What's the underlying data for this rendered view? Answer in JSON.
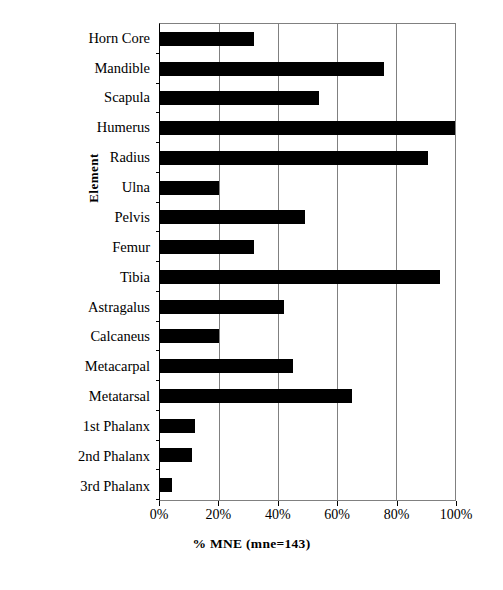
{
  "chart_data": {
    "type": "bar",
    "orientation": "horizontal",
    "title": "",
    "xlabel": "%  MNE (mne=143)",
    "ylabel": "Element",
    "xlim": [
      0,
      100
    ],
    "grid": true,
    "legend": false,
    "bar_color": "#000000",
    "grid_color": "#808080",
    "categories": [
      "Horn Core",
      "Mandible",
      "Scapula",
      "Humerus",
      "Radius",
      "Ulna",
      "Pelvis",
      "Femur",
      "Tibia",
      "Astragalus",
      "Calcaneus",
      "Metacarpal",
      "Metatarsal",
      "1st Phalanx",
      "2nd Phalanx",
      "3rd Phalanx"
    ],
    "values": [
      32,
      76,
      54,
      100,
      91,
      20,
      49,
      32,
      95,
      42,
      20,
      45,
      65,
      12,
      11,
      4
    ],
    "xticks": [
      0,
      20,
      40,
      60,
      80,
      100
    ],
    "xticklabels": [
      "0%",
      "20%",
      "40%",
      "60%",
      "80%",
      "100%"
    ]
  }
}
